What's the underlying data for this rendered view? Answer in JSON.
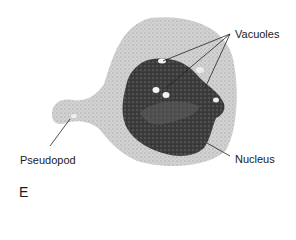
{
  "diagram": {
    "panel_letter": "E",
    "labels": {
      "vacuoles": "Vacuoles",
      "nucleus": "Nucleus",
      "pseudopod": "Pseudopod"
    },
    "colors": {
      "cytoplasm": "#cfcfcf",
      "cytoplasm_stipple": "#a8a8a8",
      "nucleus": "#3a3a3a",
      "nucleus_inner": "#5a5a5a",
      "vacuole": "#f4f4f4",
      "leader_line": "#222222"
    }
  }
}
